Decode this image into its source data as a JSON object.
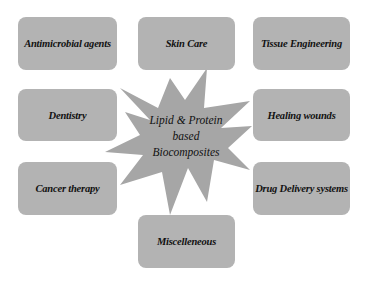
{
  "diagram": {
    "center": {
      "lines": [
        "Lipid & Protein",
        "based",
        "Biocomposites"
      ]
    },
    "nodes": [
      {
        "label": "Antimicrobial agents"
      },
      {
        "label": "Skin Care"
      },
      {
        "label": "Tissue Engineering"
      },
      {
        "label": "Dentistry"
      },
      {
        "label": "Healing wounds"
      },
      {
        "label": "Cancer therapy"
      },
      {
        "label": "Drug Delivery systems"
      },
      {
        "label": "Miscelleneous"
      }
    ],
    "colors": {
      "box_fill": "#b3b3b3",
      "star_fill": "#a6a6a6",
      "text": "#111111"
    }
  }
}
